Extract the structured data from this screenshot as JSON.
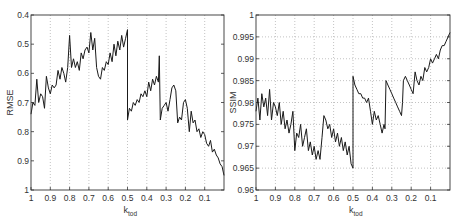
{
  "chart_data": [
    {
      "type": "line",
      "title": "",
      "xlabel": "k",
      "xlabel_sub": "tod",
      "ylabel": "RMSE",
      "xlim": [
        1,
        0
      ],
      "ylim": [
        0.4,
        1
      ],
      "y_inverted": true,
      "grid": "vertical-dotted",
      "x_ticks": [
        "1",
        "0.9",
        "0.8",
        "0.7",
        "0.6",
        "0.5",
        "0.4",
        "0.3",
        "0.2",
        "0.1"
      ],
      "x_tick_values": [
        1,
        0.9,
        0.8,
        0.7,
        0.6,
        0.5,
        0.4,
        0.3,
        0.2,
        0.1
      ],
      "y_ticks": [
        "0.4",
        "0.5",
        "0.6",
        "0.7",
        "0.8",
        "0.9",
        "1"
      ],
      "y_tick_values": [
        0.4,
        0.5,
        0.6,
        0.7,
        0.8,
        0.9,
        1.0
      ],
      "series": [
        {
          "name": "RMSE",
          "x": [
            1.0,
            0.99,
            0.98,
            0.97,
            0.96,
            0.95,
            0.94,
            0.93,
            0.92,
            0.91,
            0.9,
            0.89,
            0.88,
            0.87,
            0.86,
            0.85,
            0.84,
            0.83,
            0.82,
            0.81,
            0.8,
            0.79,
            0.78,
            0.77,
            0.76,
            0.75,
            0.74,
            0.73,
            0.72,
            0.71,
            0.7,
            0.69,
            0.68,
            0.67,
            0.66,
            0.65,
            0.64,
            0.63,
            0.62,
            0.61,
            0.6,
            0.59,
            0.58,
            0.57,
            0.56,
            0.55,
            0.54,
            0.53,
            0.52,
            0.51,
            0.5,
            0.5,
            0.49,
            0.48,
            0.47,
            0.46,
            0.45,
            0.44,
            0.43,
            0.42,
            0.41,
            0.4,
            0.39,
            0.38,
            0.37,
            0.36,
            0.35,
            0.34,
            0.335,
            0.33,
            0.32,
            0.31,
            0.3,
            0.29,
            0.28,
            0.27,
            0.26,
            0.25,
            0.24,
            0.23,
            0.22,
            0.21,
            0.2,
            0.19,
            0.18,
            0.17,
            0.16,
            0.15,
            0.14,
            0.13,
            0.12,
            0.11,
            0.1,
            0.09,
            0.08,
            0.07,
            0.06,
            0.05,
            0.04,
            0.03,
            0.02,
            0.01,
            0.0
          ],
          "values": [
            0.74,
            0.7,
            0.71,
            0.62,
            0.7,
            0.67,
            0.68,
            0.72,
            0.61,
            0.65,
            0.67,
            0.64,
            0.65,
            0.64,
            0.59,
            0.62,
            0.58,
            0.6,
            0.63,
            0.58,
            0.47,
            0.58,
            0.55,
            0.58,
            0.56,
            0.59,
            0.53,
            0.55,
            0.52,
            0.51,
            0.53,
            0.46,
            0.52,
            0.48,
            0.58,
            0.61,
            0.62,
            0.58,
            0.59,
            0.56,
            0.57,
            0.53,
            0.56,
            0.5,
            0.54,
            0.49,
            0.52,
            0.47,
            0.51,
            0.48,
            0.45,
            0.76,
            0.72,
            0.73,
            0.7,
            0.71,
            0.69,
            0.7,
            0.67,
            0.68,
            0.66,
            0.68,
            0.63,
            0.66,
            0.62,
            0.64,
            0.61,
            0.63,
            0.54,
            0.76,
            0.72,
            0.71,
            0.7,
            0.73,
            0.69,
            0.65,
            0.64,
            0.66,
            0.77,
            0.75,
            0.76,
            0.7,
            0.69,
            0.72,
            0.8,
            0.73,
            0.77,
            0.76,
            0.8,
            0.79,
            0.82,
            0.8,
            0.81,
            0.84,
            0.85,
            0.83,
            0.87,
            0.86,
            0.88,
            0.89,
            0.91,
            0.92,
            0.95
          ]
        }
      ]
    },
    {
      "type": "line",
      "title": "",
      "xlabel": "k",
      "xlabel_sub": "tod",
      "ylabel": "SSIM",
      "xlim": [
        1,
        0
      ],
      "ylim": [
        0.96,
        1
      ],
      "grid": "both-dotted",
      "x_ticks": [
        "1",
        "0.9",
        "0.8",
        "0.7",
        "0.6",
        "0.5",
        "0.4",
        "0.3",
        "0.2",
        "0.1"
      ],
      "x_tick_values": [
        1,
        0.9,
        0.8,
        0.7,
        0.6,
        0.5,
        0.4,
        0.3,
        0.2,
        0.1
      ],
      "y_ticks": [
        "0.96",
        "0.965",
        "0.97",
        "0.975",
        "0.98",
        "0.985",
        "0.99",
        "0.995",
        "1"
      ],
      "y_tick_values": [
        0.96,
        0.965,
        0.97,
        0.975,
        0.98,
        0.985,
        0.99,
        0.995,
        1.0
      ],
      "series": [
        {
          "name": "SSIM",
          "x": [
            1.0,
            0.99,
            0.98,
            0.97,
            0.96,
            0.95,
            0.94,
            0.93,
            0.92,
            0.91,
            0.9,
            0.89,
            0.88,
            0.87,
            0.86,
            0.85,
            0.84,
            0.83,
            0.82,
            0.81,
            0.8,
            0.79,
            0.78,
            0.77,
            0.76,
            0.75,
            0.74,
            0.73,
            0.72,
            0.71,
            0.7,
            0.69,
            0.68,
            0.67,
            0.66,
            0.65,
            0.64,
            0.63,
            0.62,
            0.61,
            0.6,
            0.59,
            0.58,
            0.57,
            0.56,
            0.55,
            0.54,
            0.53,
            0.52,
            0.51,
            0.5,
            0.5,
            0.49,
            0.48,
            0.47,
            0.46,
            0.45,
            0.44,
            0.43,
            0.42,
            0.41,
            0.4,
            0.39,
            0.38,
            0.37,
            0.36,
            0.35,
            0.34,
            0.335,
            0.33,
            0.32,
            0.31,
            0.3,
            0.29,
            0.28,
            0.27,
            0.26,
            0.25,
            0.245,
            0.24,
            0.23,
            0.22,
            0.21,
            0.2,
            0.19,
            0.18,
            0.17,
            0.16,
            0.15,
            0.14,
            0.13,
            0.12,
            0.11,
            0.1,
            0.09,
            0.08,
            0.07,
            0.06,
            0.05,
            0.04,
            0.03,
            0.02,
            0.01,
            0.0
          ],
          "values": [
            0.978,
            0.981,
            0.976,
            0.982,
            0.979,
            0.981,
            0.977,
            0.983,
            0.976,
            0.98,
            0.979,
            0.977,
            0.98,
            0.975,
            0.978,
            0.974,
            0.976,
            0.973,
            0.975,
            0.978,
            0.969,
            0.973,
            0.972,
            0.975,
            0.97,
            0.972,
            0.974,
            0.969,
            0.971,
            0.968,
            0.97,
            0.967,
            0.969,
            0.967,
            0.972,
            0.977,
            0.976,
            0.974,
            0.975,
            0.972,
            0.974,
            0.971,
            0.973,
            0.97,
            0.972,
            0.969,
            0.971,
            0.968,
            0.97,
            0.966,
            0.965,
            0.986,
            0.984,
            0.983,
            0.982,
            0.982,
            0.981,
            0.981,
            0.98,
            0.981,
            0.978,
            0.975,
            0.978,
            0.976,
            0.977,
            0.975,
            0.973,
            0.975,
            0.974,
            0.985,
            0.984,
            0.983,
            0.982,
            0.981,
            0.98,
            0.979,
            0.978,
            0.977,
            0.98,
            0.985,
            0.986,
            0.985,
            0.984,
            0.983,
            0.982,
            0.987,
            0.985,
            0.984,
            0.986,
            0.985,
            0.988,
            0.987,
            0.988,
            0.99,
            0.989,
            0.99,
            0.991,
            0.99,
            0.992,
            0.993,
            0.993,
            0.994,
            0.995,
            0.996
          ]
        }
      ]
    }
  ],
  "charts": {
    "left": {
      "ylabel": "RMSE",
      "xlabel_main": "k",
      "xlabel_sub": "tod",
      "x_ticks": [
        "1",
        "0.9",
        "0.8",
        "0.7",
        "0.6",
        "0.5",
        "0.4",
        "0.3",
        "0.2",
        "0.1"
      ],
      "y_ticks": [
        "0.4",
        "0.5",
        "0.6",
        "0.7",
        "0.8",
        "0.9",
        "1"
      ]
    },
    "right": {
      "ylabel": "SSIM",
      "xlabel_main": "k",
      "xlabel_sub": "tod",
      "x_ticks": [
        "1",
        "0.9",
        "0.8",
        "0.7",
        "0.6",
        "0.5",
        "0.4",
        "0.3",
        "0.2",
        "0.1"
      ],
      "y_ticks": [
        "0.96",
        "0.965",
        "0.97",
        "0.975",
        "0.98",
        "0.985",
        "0.99",
        "0.995",
        "1"
      ]
    }
  },
  "colors": {
    "line": "#1a1a1a",
    "axis": "#333333",
    "grid": "#9a9a9a"
  }
}
